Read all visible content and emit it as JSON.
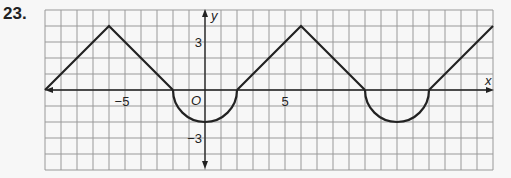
{
  "problem": {
    "number": "23."
  },
  "chart_data": {
    "type": "line",
    "title": "",
    "xlabel": "x",
    "ylabel": "y",
    "origin_label": "O",
    "xlim": [
      -10,
      18
    ],
    "ylim": [
      -5,
      5
    ],
    "grid": true,
    "x_tick_labels": [
      {
        "value": -5,
        "label": "−5"
      },
      {
        "value": 5,
        "label": "5"
      }
    ],
    "y_tick_labels": [
      {
        "value": 3,
        "label": "3"
      },
      {
        "value": -3,
        "label": "−3"
      }
    ],
    "segments": [
      {
        "kind": "line",
        "points": [
          [
            -10,
            0
          ],
          [
            -6,
            4
          ],
          [
            -2,
            0
          ]
        ]
      },
      {
        "kind": "semicircle",
        "center": [
          0,
          0
        ],
        "radius": 2,
        "half": "lower"
      },
      {
        "kind": "line",
        "points": [
          [
            2,
            0
          ],
          [
            6,
            4
          ],
          [
            10,
            0
          ]
        ]
      },
      {
        "kind": "semicircle",
        "center": [
          12,
          0
        ],
        "radius": 2,
        "half": "lower"
      },
      {
        "kind": "line",
        "points": [
          [
            14,
            0
          ],
          [
            18,
            4
          ]
        ]
      }
    ],
    "periodic": true,
    "period": 12
  }
}
